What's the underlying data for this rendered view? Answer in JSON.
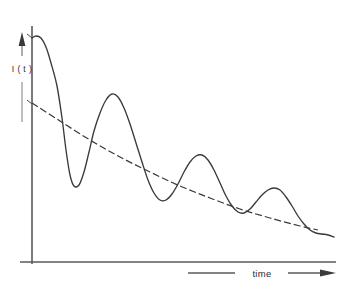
{
  "figure": {
    "background_color": "#ffffff",
    "ink_color": "#3a3a3a",
    "axis_color": "#555555",
    "width": 343,
    "height": 289
  },
  "labels": {
    "y_axis": "I ( t )",
    "x_axis": "time"
  },
  "icons": {
    "y_axis_arrow": "arrow-up-icon",
    "x_axis_arrow": "arrow-right-icon",
    "y_label_pointer_top": "arrow-pointer-icon",
    "y_label_pointer_bottom": "arrow-pointer-icon"
  },
  "axes": {
    "origin_x": 32,
    "origin_y": 262,
    "y_axis_top": 26,
    "x_axis_right": 335,
    "x_axis_tick_start": 32
  },
  "chart_data": {
    "type": "line",
    "title": "",
    "xlabel": "time",
    "ylabel": "I ( t )",
    "grid": false,
    "legend": "none",
    "xlim": [
      0,
      1
    ],
    "ylim": [
      0,
      1
    ],
    "axis_ticks": "none",
    "series": [
      {
        "name": "damped-oscillation",
        "style": "solid",
        "description": "Damped sinusoid I(t) decaying with time, four visible maxima of decreasing amplitude",
        "points": [
          [
            32,
            38
          ],
          [
            36,
            36
          ],
          [
            41,
            38
          ],
          [
            46,
            47
          ],
          [
            51,
            63
          ],
          [
            57,
            86
          ],
          [
            62,
            118
          ],
          [
            66,
            150
          ],
          [
            70,
            175
          ],
          [
            74,
            186
          ],
          [
            79,
            185
          ],
          [
            84,
            172
          ],
          [
            89,
            152
          ],
          [
            94,
            131
          ],
          [
            100,
            113
          ],
          [
            106,
            100
          ],
          [
            112,
            94
          ],
          [
            118,
            97
          ],
          [
            124,
            108
          ],
          [
            130,
            124
          ],
          [
            136,
            143
          ],
          [
            142,
            162
          ],
          [
            148,
            180
          ],
          [
            154,
            193
          ],
          [
            160,
            200
          ],
          [
            166,
            200
          ],
          [
            172,
            194
          ],
          [
            178,
            184
          ],
          [
            184,
            172
          ],
          [
            190,
            162
          ],
          [
            196,
            156
          ],
          [
            202,
            155
          ],
          [
            208,
            160
          ],
          [
            214,
            170
          ],
          [
            220,
            183
          ],
          [
            226,
            196
          ],
          [
            232,
            206
          ],
          [
            238,
            212
          ],
          [
            244,
            213
          ],
          [
            250,
            209
          ],
          [
            256,
            202
          ],
          [
            262,
            195
          ],
          [
            268,
            190
          ],
          [
            274,
            188
          ],
          [
            280,
            190
          ],
          [
            286,
            197
          ],
          [
            292,
            206
          ],
          [
            298,
            216
          ],
          [
            304,
            224
          ],
          [
            310,
            230
          ],
          [
            316,
            233
          ],
          [
            322,
            234
          ],
          [
            328,
            235
          ],
          [
            334,
            237
          ]
        ],
        "maxima": [
          [
            36,
            36
          ],
          [
            112,
            94
          ],
          [
            202,
            155
          ],
          [
            274,
            188
          ]
        ],
        "minima": [
          [
            76,
            186
          ],
          [
            162,
            200
          ],
          [
            244,
            213
          ],
          [
            330,
            235
          ]
        ]
      },
      {
        "name": "exponential-envelope",
        "style": "dashed",
        "description": "Dashed exponential decay envelope through the oscillation",
        "points": [
          [
            32,
            103
          ],
          [
            60,
            121
          ],
          [
            90,
            140
          ],
          [
            120,
            157
          ],
          [
            150,
            172
          ],
          [
            180,
            186
          ],
          [
            210,
            198
          ],
          [
            240,
            209
          ],
          [
            270,
            218
          ],
          [
            300,
            226
          ],
          [
            318,
            230
          ]
        ],
        "dash_pattern": "7 3"
      }
    ]
  }
}
